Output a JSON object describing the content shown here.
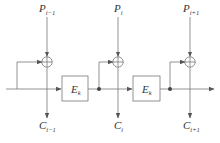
{
  "diagram": {
    "type": "block-cipher-mode",
    "colors": {
      "stroke": "#666666",
      "text": "#333333",
      "background": "#ffffff",
      "node_fill": "#444444"
    },
    "stages": [
      {
        "input": {
          "main": "P",
          "sub": "i−1"
        },
        "output": {
          "main": "C",
          "sub": "i−1"
        }
      },
      {
        "input": {
          "main": "P",
          "sub": "i"
        },
        "output": {
          "main": "C",
          "sub": "i"
        }
      },
      {
        "input": {
          "main": "P",
          "sub": "i+1"
        },
        "output": {
          "main": "C",
          "sub": "i+1"
        }
      }
    ],
    "blocks": [
      {
        "main": "E",
        "sub": "k"
      },
      {
        "main": "E",
        "sub": "k"
      }
    ],
    "operators": [
      "xor",
      "xor",
      "xor"
    ]
  }
}
